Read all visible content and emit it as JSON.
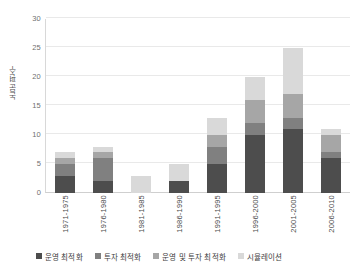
{
  "chart_data": {
    "type": "bar",
    "subtype": "stacked-bar",
    "title": "",
    "xlabel": "",
    "ylabel": "논문 편수",
    "ylim": [
      0,
      30
    ],
    "ytick_values": [
      0,
      5,
      10,
      15,
      20,
      25,
      30
    ],
    "ytick_labels": [
      "0",
      "5",
      "10",
      "15",
      "20",
      "25",
      "30"
    ],
    "grid": true,
    "grid_axis": "y",
    "legend_position": "bottom",
    "categories": [
      "1971-1975",
      "1976-1980",
      "1981-1985",
      "1986-1990",
      "1991-1995",
      "1996-2000",
      "2001-2005",
      "2006-2010"
    ],
    "series": [
      {
        "name": "운영 최적화",
        "color": "#4d4d4d",
        "values": [
          3,
          2,
          0,
          2,
          5,
          10,
          11,
          6
        ]
      },
      {
        "name": "투자 최적화",
        "color": "#808080",
        "values": [
          2,
          4,
          0,
          0,
          3,
          2,
          2,
          1
        ]
      },
      {
        "name": "운영 및 투자 최적화",
        "color": "#a6a6a6",
        "values": [
          1,
          1,
          0,
          0,
          2,
          4,
          4,
          3
        ]
      },
      {
        "name": "시뮬레이션",
        "color": "#d9d9d9",
        "values": [
          1,
          1,
          3,
          3,
          3,
          4,
          8,
          1
        ]
      }
    ],
    "totals": [
      7,
      8,
      3,
      5,
      13,
      20,
      25,
      11
    ]
  }
}
